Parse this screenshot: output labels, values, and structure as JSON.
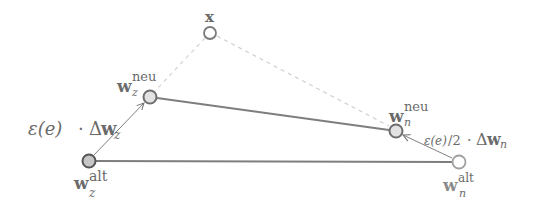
{
  "diagram": {
    "nodes": [
      {
        "id": "x",
        "label_base": "x",
        "label_sup": "",
        "label_sub": "",
        "fill": "#ffffff",
        "stroke": "#7a7a7a"
      },
      {
        "id": "wz_neu",
        "label_base": "w",
        "label_sup": "neu",
        "label_sub": "z",
        "fill": "#e2e2e2",
        "stroke": "#6e6e6e"
      },
      {
        "id": "wz_alt",
        "label_base": "w",
        "label_sup": "alt",
        "label_sub": "z",
        "fill": "#c6c6c6",
        "stroke": "#555555"
      },
      {
        "id": "wn_neu",
        "label_base": "w",
        "label_sup": "neu",
        "label_sub": "n",
        "fill": "#e2e2e2",
        "stroke": "#6e6e6e"
      },
      {
        "id": "wn_alt",
        "label_base": "w",
        "label_sup": "alt",
        "label_sub": "n",
        "fill": "#ffffff",
        "stroke": "#a0a0a0"
      }
    ],
    "edges": [
      {
        "from": "wz_alt",
        "to": "wn_alt",
        "style": "solid"
      },
      {
        "from": "wz_neu",
        "to": "wn_neu",
        "style": "solid"
      },
      {
        "from": "x",
        "to": "wz_neu",
        "style": "dashed"
      },
      {
        "from": "x",
        "to": "wn_neu",
        "style": "dashed"
      },
      {
        "from": "wz_alt",
        "to": "wz_neu",
        "style": "arrow"
      },
      {
        "from": "wn_alt",
        "to": "wn_neu",
        "style": "arrow"
      }
    ],
    "annotations": {
      "winner_update": {
        "eps": "ε(e)",
        "dot": "·",
        "delta": "Δ",
        "w": "w",
        "sub": "z"
      },
      "neighbor_update": {
        "eps": "ε(e)",
        "frac": "/2",
        "dot": "·",
        "delta": "Δ",
        "w": "w",
        "sub": "n"
      }
    },
    "colors": {
      "line": "#808080",
      "dashed": "#cfcfcf",
      "text": "#6a6a6a"
    }
  }
}
